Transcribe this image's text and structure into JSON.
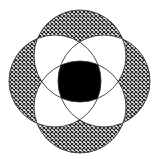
{
  "diagram": {
    "title": "Four overlapping circles",
    "circles": [
      {
        "name": "top",
        "cx": 80,
        "cy": 56,
        "r": 46
      },
      {
        "name": "right",
        "cx": 104,
        "cy": 81,
        "r": 46
      },
      {
        "name": "bottom",
        "cx": 80,
        "cy": 107,
        "r": 46
      },
      {
        "name": "left",
        "cx": 55,
        "cy": 81,
        "r": 46
      }
    ],
    "fills": {
      "single": "crosshatch",
      "double": "#ffffff",
      "all_four": "#000000"
    },
    "colors": {
      "hatch": "#1a1a1a",
      "stroke": "#333333",
      "background": "#ffffff"
    }
  }
}
